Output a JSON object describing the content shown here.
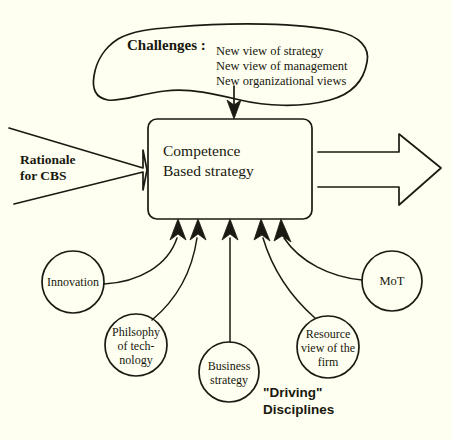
{
  "diagram": {
    "title_node": {
      "label": "Challenges :",
      "items": [
        "New view of strategy",
        "New view of management",
        "New organizational views"
      ]
    },
    "center_box": {
      "line1": "Competence",
      "line2": "Based strategy"
    },
    "left_arrow": {
      "line1": "Rationale",
      "line2": "for CBS"
    },
    "right_arrow": {
      "label": ""
    },
    "disciplines_caption": {
      "line1": "\"Driving\"",
      "line2": "Disciplines"
    },
    "circles": [
      {
        "name": "innovation",
        "lines": [
          "Innovation"
        ],
        "cx": 73,
        "cy": 282,
        "r": 31
      },
      {
        "name": "philosophy",
        "lines": [
          "Philsophy",
          "of tech-",
          "nology"
        ],
        "cx": 136,
        "cy": 345,
        "r": 31
      },
      {
        "name": "business",
        "lines": [
          "Business",
          "strategy"
        ],
        "cx": 229,
        "cy": 372,
        "r": 30
      },
      {
        "name": "resource",
        "lines": [
          "Resource",
          "view of the",
          "firm"
        ],
        "cx": 328,
        "cy": 347,
        "r": 31
      },
      {
        "name": "mot",
        "lines": [
          "MoT"
        ],
        "cx": 392,
        "cy": 281,
        "r": 30
      }
    ],
    "colors": {
      "background": "#fefff0",
      "ink": "#1a1a12"
    }
  }
}
